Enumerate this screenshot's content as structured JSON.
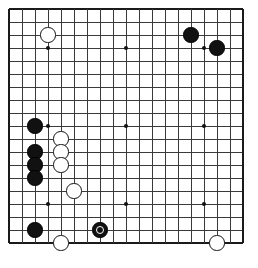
{
  "board": {
    "title": "Go board diagram",
    "size": 19,
    "origin_x": 9,
    "origin_y": 9,
    "spacing": 13,
    "line_color": "#3a3a3a",
    "border_color": "#1a1a1a",
    "background_color": "#ffffff",
    "black_color": "#111111",
    "white_color": "#ffffff",
    "stone_radius": 7.6,
    "star_points": [
      {
        "col": 3,
        "row": 3
      },
      {
        "col": 9,
        "row": 3
      },
      {
        "col": 15,
        "row": 3
      },
      {
        "col": 3,
        "row": 9
      },
      {
        "col": 9,
        "row": 9
      },
      {
        "col": 15,
        "row": 9
      },
      {
        "col": 3,
        "row": 15
      },
      {
        "col": 9,
        "row": 15
      },
      {
        "col": 15,
        "row": 15
      }
    ],
    "stones": [
      {
        "color": "white",
        "col": 3,
        "row": 2,
        "label": "white-stone-upper-left"
      },
      {
        "color": "black",
        "col": 14,
        "row": 2,
        "label": "black-stone-upper-right-1"
      },
      {
        "color": "black",
        "col": 16,
        "row": 3,
        "label": "black-stone-upper-right-2"
      },
      {
        "color": "black",
        "col": 2,
        "row": 9,
        "label": "black-stone-left-1"
      },
      {
        "color": "white",
        "col": 4,
        "row": 10,
        "label": "white-stone-left-1"
      },
      {
        "color": "black",
        "col": 2,
        "row": 11,
        "label": "black-stone-left-2"
      },
      {
        "color": "white",
        "col": 4,
        "row": 11,
        "label": "white-stone-left-2"
      },
      {
        "color": "black",
        "col": 2,
        "row": 12,
        "label": "black-stone-left-3"
      },
      {
        "color": "white",
        "col": 4,
        "row": 12,
        "label": "white-stone-left-3"
      },
      {
        "color": "black",
        "col": 2,
        "row": 13,
        "label": "black-stone-left-4"
      },
      {
        "color": "white",
        "col": 5,
        "row": 14,
        "label": "white-stone-left-4"
      },
      {
        "color": "black",
        "col": 2,
        "row": 17,
        "label": "black-stone-lower-left"
      },
      {
        "color": "black",
        "col": 7,
        "row": 17,
        "marked": true,
        "label": "black-stone-marked"
      },
      {
        "color": "white",
        "col": 4,
        "row": 18,
        "label": "white-stone-lower-left"
      },
      {
        "color": "white",
        "col": 16,
        "row": 18,
        "label": "white-stone-lower-right"
      }
    ],
    "counts": {
      "black_stones": "8",
      "white_stones": "7",
      "marked_stones": "1"
    }
  }
}
